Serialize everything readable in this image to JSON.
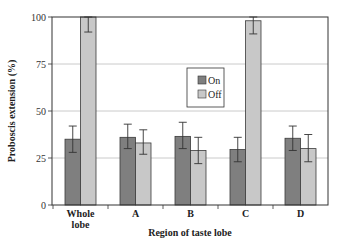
{
  "chart_data": {
    "type": "bar",
    "title": "",
    "xlabel": "Region of taste lobe",
    "ylabel": "Proboscis extension (%)",
    "ylim": [
      0,
      100
    ],
    "yticks": [
      0,
      25,
      50,
      75,
      100
    ],
    "grid": true,
    "legend_position": "inside-center-upper",
    "categories": [
      "Whole lobe",
      "A",
      "B",
      "C",
      "D"
    ],
    "category_lines": [
      [
        "Whole",
        "lobe"
      ],
      [
        "A"
      ],
      [
        "B"
      ],
      [
        "C"
      ],
      [
        "D"
      ]
    ],
    "series": [
      {
        "name": "On",
        "color": "#7f7f7f",
        "values": [
          35,
          36,
          36.5,
          29.5,
          35.5
        ],
        "err_low": [
          28,
          30,
          30,
          23,
          29
        ],
        "err_high": [
          42,
          43,
          44,
          36,
          42
        ]
      },
      {
        "name": "Off",
        "color": "#c8c8c8",
        "values": [
          100,
          33,
          29,
          98,
          30
        ],
        "err_low": [
          92,
          27,
          22,
          91,
          23
        ],
        "err_high": [
          100,
          40,
          36,
          100,
          37.5
        ]
      }
    ]
  },
  "legend": {
    "items": [
      {
        "label": "On",
        "color": "#7f7f7f"
      },
      {
        "label": "Off",
        "color": "#c8c8c8"
      }
    ]
  }
}
